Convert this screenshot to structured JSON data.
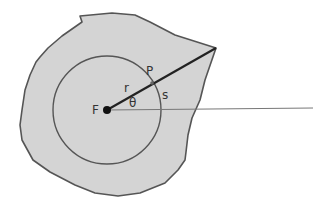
{
  "diagram": {
    "labels": {
      "focus": "F",
      "point": "P",
      "radius": "r",
      "arc": "s",
      "angle": "θ"
    },
    "colors": {
      "region_fill": "#d4d4d4",
      "outline": "#555555",
      "circle": "#555555",
      "ray": "#222222",
      "axis": "#777777",
      "focus": "#111111"
    }
  }
}
